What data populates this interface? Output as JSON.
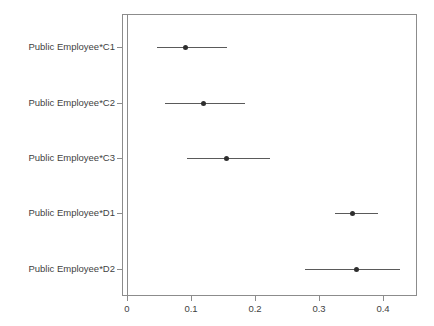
{
  "chart_data": {
    "type": "scatter",
    "subtype": "forest-plot",
    "title": "",
    "xlabel": "",
    "ylabel": "",
    "xlim": [
      -0.008,
      0.453
    ],
    "ylim_categories_top_to_bottom": true,
    "grid": false,
    "legend": null,
    "x_ticks": [
      {
        "value": 0,
        "label": "0"
      },
      {
        "value": 0.1,
        "label": "0.1"
      },
      {
        "value": 0.2,
        "label": "0.2"
      },
      {
        "value": 0.3,
        "label": "0.3"
      },
      {
        "value": 0.4,
        "label": "0.4"
      }
    ],
    "reference_line_x": 0,
    "categories": [
      "Public Employee*C1",
      "Public Employee*C2",
      "Public Employee*C3",
      "Public Employee*D1",
      "Public Employee*D2"
    ],
    "points": [
      {
        "label": "Public Employee*C1",
        "estimate": 0.092,
        "ci_low": 0.047,
        "ci_high": 0.156
      },
      {
        "label": "Public Employee*C2",
        "estimate": 0.119,
        "ci_low": 0.059,
        "ci_high": 0.184
      },
      {
        "label": "Public Employee*C3",
        "estimate": 0.155,
        "ci_low": 0.094,
        "ci_high": 0.223
      },
      {
        "label": "Public Employee*D1",
        "estimate": 0.353,
        "ci_low": 0.325,
        "ci_high": 0.392
      },
      {
        "label": "Public Employee*D2",
        "estimate": 0.359,
        "ci_low": 0.278,
        "ci_high": 0.427
      }
    ]
  },
  "colors": {
    "axis": "#8c8c8c",
    "point": "#2e2e2e",
    "ci": "#5a5a5a",
    "text": "#3f3f3f",
    "background": "#ffffff"
  }
}
